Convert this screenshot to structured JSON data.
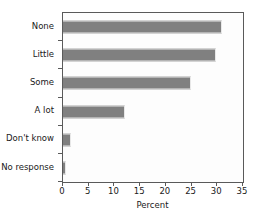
{
  "chart_data": {
    "type": "bar",
    "orientation": "horizontal",
    "title": "",
    "subtitle": "",
    "xlabel": "Percent",
    "ylabel": "",
    "categories": [
      "None",
      "Little",
      "Some",
      "A lot",
      "Don't know",
      "No response"
    ],
    "values": [
      31,
      29.8,
      24.8,
      12,
      1.5,
      0.5
    ],
    "series": [
      {
        "name": "Percent",
        "values": [
          31,
          29.8,
          24.8,
          12,
          1.5,
          0.5
        ]
      }
    ],
    "xlim": [
      0,
      35
    ],
    "xticks": [
      0,
      5,
      10,
      15,
      20,
      25,
      30,
      35
    ],
    "xtick_labels": [
      "0",
      "5",
      "10",
      "15",
      "20",
      "25",
      "30",
      "35"
    ],
    "grid": false,
    "legend": "none",
    "bar_color": "#808080",
    "plot_background": "#fdfdfd",
    "frame_color": "#5a5a5a",
    "text_color": "#1a1a1a"
  }
}
